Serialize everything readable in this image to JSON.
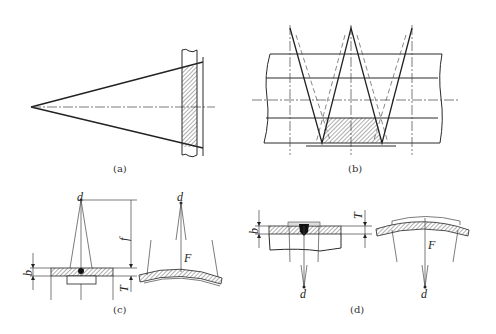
{
  "figure": {
    "panels": [
      {
        "id": "a",
        "caption": "(a)"
      },
      {
        "id": "b",
        "caption": "(b)"
      },
      {
        "id": "c",
        "caption": "(c)",
        "labels": {
          "source": "d",
          "focal": "f",
          "width": "b",
          "thickness": "T",
          "distance": "F",
          "source_right": "d"
        }
      },
      {
        "id": "d",
        "caption": "(d)",
        "labels": {
          "source": "d",
          "width": "b",
          "thickness": "T",
          "distance": "F",
          "source_right": "d"
        }
      }
    ]
  }
}
